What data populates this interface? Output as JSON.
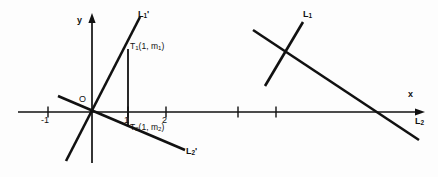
{
  "figure": {
    "background_color": "#fdfdfd",
    "stroke_color": "#111111"
  },
  "left_diagram": {
    "axes": {
      "x_axis_label": "",
      "y_axis_label": "y",
      "origin_label": "O",
      "x_ticks": [
        {
          "label": "-1",
          "value": -1
        },
        {
          "label": "1",
          "value": 1
        },
        {
          "label": "2",
          "value": 2
        },
        {
          "label": "",
          "value": 3
        },
        {
          "label": "",
          "value": 4
        }
      ]
    },
    "lines": [
      {
        "name": "L1prime",
        "base": "L",
        "sub": "1",
        "prime": "'"
      },
      {
        "name": "L2prime",
        "base": "L",
        "sub": "2",
        "prime": "'"
      }
    ],
    "points": [
      {
        "name": "T1",
        "base": "T",
        "sub": "1",
        "coords": "(1, m",
        "coord_sub": "1",
        "coord_tail": ")"
      },
      {
        "name": "T2",
        "base": "T",
        "sub": "2",
        "coords": "(1, m",
        "coord_sub": "2",
        "coord_tail": ")"
      }
    ],
    "point_labels": {
      "t1_full": "T₁(1, m₁)",
      "t2_full": "T₂(1, m₂)"
    }
  },
  "right_diagram": {
    "axes": {
      "x_axis_label": "x",
      "x_ticks": [
        {
          "label": "",
          "value": 1
        },
        {
          "label": "",
          "value": 2
        }
      ]
    },
    "lines": [
      {
        "name": "L1",
        "base": "L",
        "sub": "1",
        "prime": ""
      },
      {
        "name": "L2",
        "base": "L",
        "sub": "2",
        "prime": ""
      }
    ]
  },
  "labels": {
    "y_axis": "y",
    "x_axis": "x",
    "origin": "O",
    "tick_minus_one": "-1",
    "tick_one": "1",
    "tick_two": "2",
    "L": "L",
    "sub_one": "1",
    "sub_two": "2",
    "prime": "'",
    "T": "T",
    "t1_coords": "(1, m",
    "t2_coords": "(1, m",
    "coord_close": ")"
  }
}
